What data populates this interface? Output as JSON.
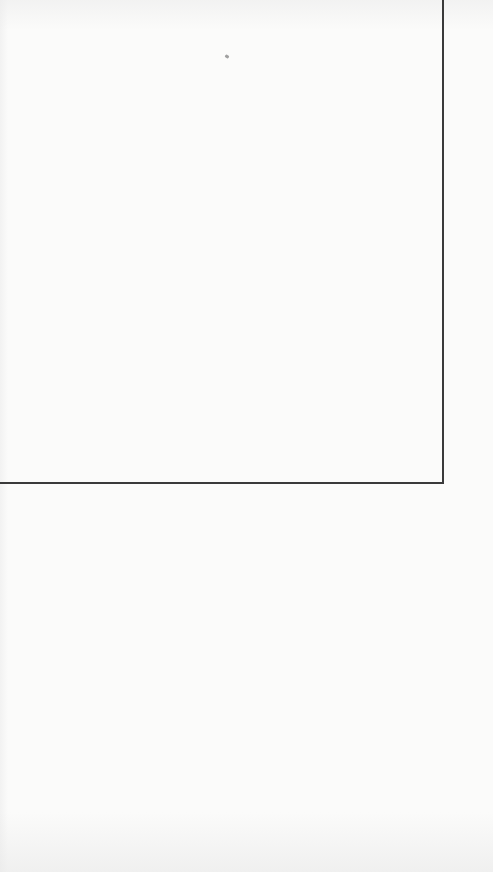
{
  "page": {
    "background_color": "#fbfbfa",
    "frame_border_color": "#3a3a3a",
    "text_content": []
  }
}
